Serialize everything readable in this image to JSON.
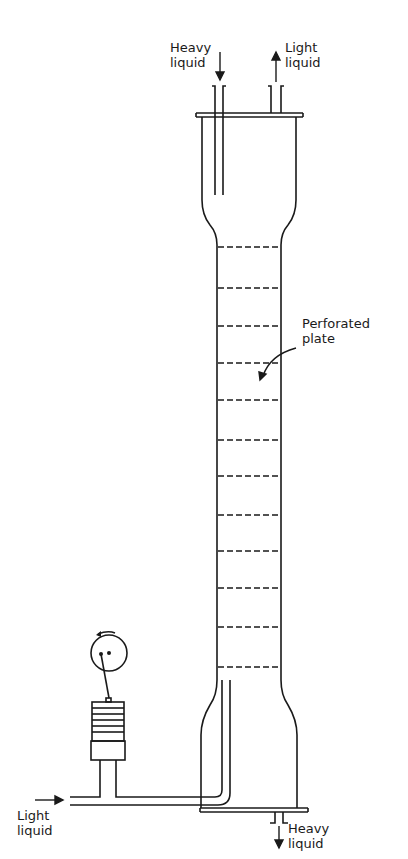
{
  "diagram": {
    "labels": {
      "heavy_in": [
        "Heavy",
        "liquid"
      ],
      "light_out": [
        "Light",
        "liquid"
      ],
      "plate": [
        "Perforated",
        "plate"
      ],
      "light_in": [
        "Light",
        "liquid"
      ],
      "heavy_out": [
        "Heavy",
        "liquid"
      ]
    },
    "plate_count": 12,
    "plate_y": [
      247,
      288,
      326,
      363,
      400,
      440,
      476,
      515,
      551,
      588,
      627,
      667
    ],
    "colors": {
      "line": "#1a1a1a",
      "background": "#ffffff"
    }
  }
}
